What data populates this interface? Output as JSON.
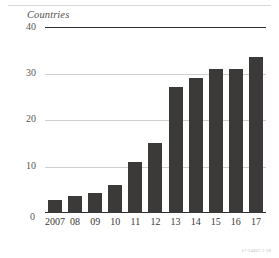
{
  "figure": {
    "credit": "17-14007 1-18"
  },
  "chart_data": {
    "type": "bar",
    "title": "",
    "subtitle": "",
    "ylabel": "Countries",
    "xlabel": "",
    "categories": [
      "2007",
      "08",
      "09",
      "10",
      "11",
      "12",
      "13",
      "14",
      "15",
      "16",
      "17"
    ],
    "values": [
      2.8,
      3.6,
      4.3,
      6,
      11,
      15,
      27,
      29,
      31,
      31,
      33.5
    ],
    "series": [
      {
        "name": "Countries",
        "values": [
          2.8,
          3.6,
          4.3,
          6,
          11,
          15,
          27,
          29,
          31,
          31,
          33.5
        ]
      }
    ],
    "ylim": [
      0,
      40
    ],
    "yticks": [
      0,
      10,
      20,
      30,
      40
    ],
    "ytick_labels": [
      "0",
      "10",
      "20",
      "30",
      "40"
    ],
    "grid": true,
    "grid_axis": "y",
    "legend": false,
    "legend_position": "none",
    "bar_color": "#3c3a38",
    "gridline_color": "#cfcfcf",
    "axis_color": "#2e2e2e"
  }
}
